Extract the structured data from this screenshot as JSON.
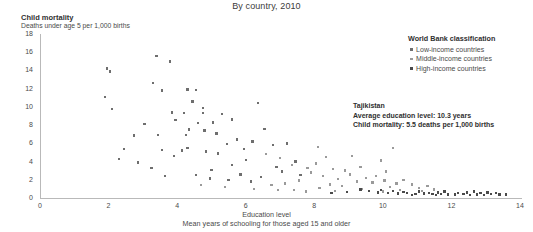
{
  "subtitle": "By country, 2010",
  "yaxis": {
    "title": "Child mortality",
    "subtitle": "Deaths under age 5 per 1,000 births"
  },
  "xaxis": {
    "title": "Education level",
    "subtitle": "Mean years of schooling for those aged 15 and older"
  },
  "legend": {
    "title": "World Bank classification",
    "items": [
      {
        "label": "Low-income countries",
        "color": "#6e6e6e"
      },
      {
        "label": "Middle-income countries",
        "color": "#9a9a9a"
      },
      {
        "label": "High-income countries",
        "color": "#4a4a4a"
      }
    ]
  },
  "annotation": {
    "name": "Tajikistan",
    "line1": "Average education level: 10.3 years",
    "line2": "Child mortality: 5.5 deaths per 1,000 births"
  },
  "chart_data": {
    "type": "scatter",
    "title": "",
    "subtitle": "By country, 2010",
    "xlabel": "Education level",
    "xlabel_sub": "Mean years of schooling for those aged 15 and older",
    "ylabel": "Child mortality",
    "ylabel_sub": "Deaths under age 5 per 1,000 births",
    "xlim": [
      0,
      14
    ],
    "ylim": [
      0,
      18
    ],
    "xticks": [
      0,
      2,
      4,
      6,
      8,
      10,
      12,
      14
    ],
    "yticks": [
      0,
      2,
      4,
      6,
      8,
      10,
      12,
      14,
      16,
      18
    ],
    "grid": false,
    "legend_position": "top-right",
    "marker": "square",
    "marker_size_px": 2.4,
    "series": [
      {
        "name": "Low-income countries",
        "color": "#6e6e6e",
        "points": [
          [
            1.95,
            14.2
          ],
          [
            2.05,
            13.9
          ],
          [
            1.9,
            11.1
          ],
          [
            2.1,
            9.8
          ],
          [
            3.4,
            15.6
          ],
          [
            3.8,
            15.0
          ],
          [
            3.3,
            12.6
          ],
          [
            3.55,
            11.8
          ],
          [
            4.3,
            11.9
          ],
          [
            4.55,
            11.85
          ],
          [
            4.45,
            10.6
          ],
          [
            4.75,
            9.9
          ],
          [
            3.85,
            9.4
          ],
          [
            4.2,
            9.35
          ],
          [
            4.75,
            9.3
          ],
          [
            3.95,
            8.55
          ],
          [
            4.6,
            8.2
          ],
          [
            3.05,
            8.1
          ],
          [
            4.35,
            7.5
          ],
          [
            4.8,
            7.4
          ],
          [
            3.45,
            6.9
          ],
          [
            4.25,
            6.9
          ],
          [
            2.75,
            6.85
          ],
          [
            5.05,
            8.3
          ],
          [
            4.3,
            5.5
          ],
          [
            4.85,
            5.1
          ],
          [
            3.9,
            4.6
          ],
          [
            5.3,
            9.2
          ],
          [
            5.6,
            8.6
          ],
          [
            5.15,
            7.1
          ],
          [
            5.75,
            6.4
          ],
          [
            5.45,
            5.9
          ],
          [
            5.95,
            5.4
          ],
          [
            5.2,
            4.9
          ],
          [
            6.0,
            4.2
          ],
          [
            5.6,
            3.6
          ],
          [
            6.35,
            10.4
          ],
          [
            6.55,
            7.6
          ],
          [
            6.2,
            6.2
          ],
          [
            6.8,
            5.8
          ],
          [
            2.45,
            5.4
          ],
          [
            3.55,
            5.3
          ],
          [
            4.15,
            5.2
          ],
          [
            5.0,
            3.1
          ],
          [
            5.85,
            2.6
          ],
          [
            6.45,
            2.3
          ],
          [
            4.55,
            2.5
          ],
          [
            3.65,
            2.4
          ],
          [
            4.95,
            2.15
          ],
          [
            5.5,
            1.95
          ],
          [
            6.15,
            1.8
          ],
          [
            6.9,
            3.4
          ],
          [
            7.2,
            6.0
          ],
          [
            7.45,
            4.0
          ],
          [
            7.05,
            2.9
          ],
          [
            7.6,
            2.5
          ],
          [
            2.85,
            3.9
          ],
          [
            3.25,
            3.3
          ],
          [
            2.3,
            4.3
          ]
        ]
      },
      {
        "name": "Middle-income countries",
        "color": "#9a9a9a",
        "points": [
          [
            6.6,
            4.8
          ],
          [
            7.0,
            4.4
          ],
          [
            7.35,
            3.6
          ],
          [
            7.8,
            3.3
          ],
          [
            8.1,
            5.6
          ],
          [
            8.35,
            4.5
          ],
          [
            8.05,
            3.8
          ],
          [
            8.55,
            3.2
          ],
          [
            7.9,
            2.8
          ],
          [
            8.25,
            2.4
          ],
          [
            8.7,
            2.1
          ],
          [
            8.9,
            3.0
          ],
          [
            9.1,
            4.6
          ],
          [
            9.35,
            3.4
          ],
          [
            9.05,
            2.6
          ],
          [
            9.5,
            2.2
          ],
          [
            9.25,
            1.8
          ],
          [
            9.7,
            1.7
          ],
          [
            8.45,
            1.5
          ],
          [
            8.8,
            1.3
          ],
          [
            9.95,
            4.1
          ],
          [
            10.1,
            2.9
          ],
          [
            9.8,
            2.4
          ],
          [
            10.3,
            5.5
          ],
          [
            10.05,
            1.9
          ],
          [
            10.4,
            1.6
          ],
          [
            10.2,
            1.2
          ],
          [
            10.6,
            2.0
          ],
          [
            7.55,
            1.9
          ],
          [
            7.15,
            1.6
          ],
          [
            6.75,
            1.4
          ],
          [
            8.15,
            1.1
          ],
          [
            9.4,
            1.0
          ],
          [
            10.85,
            1.5
          ],
          [
            11.05,
            1.1
          ],
          [
            10.5,
            0.9
          ],
          [
            7.4,
            0.9
          ],
          [
            8.6,
            0.8
          ],
          [
            9.6,
            0.75
          ],
          [
            10.0,
            0.7
          ],
          [
            11.3,
            1.3
          ],
          [
            11.5,
            0.95
          ],
          [
            11.15,
            0.8
          ],
          [
            6.95,
            0.85
          ],
          [
            5.4,
            1.2
          ],
          [
            6.25,
            1.0
          ],
          [
            4.7,
            1.4
          ],
          [
            7.75,
            0.7
          ]
        ]
      },
      {
        "name": "High-income countries",
        "color": "#4a4a4a",
        "points": [
          [
            9.85,
            0.6
          ],
          [
            10.15,
            0.55
          ],
          [
            10.45,
            0.5
          ],
          [
            10.7,
            0.58
          ],
          [
            10.95,
            0.45
          ],
          [
            11.2,
            0.48
          ],
          [
            11.45,
            0.42
          ],
          [
            11.7,
            0.45
          ],
          [
            11.9,
            0.4
          ],
          [
            12.1,
            0.38
          ],
          [
            12.35,
            0.42
          ],
          [
            12.55,
            0.36
          ],
          [
            12.75,
            0.4
          ],
          [
            12.95,
            0.35
          ],
          [
            13.15,
            0.45
          ],
          [
            13.4,
            0.4
          ],
          [
            13.6,
            0.38
          ],
          [
            12.2,
            0.55
          ],
          [
            11.6,
            0.62
          ],
          [
            11.05,
            0.7
          ],
          [
            10.3,
            0.75
          ],
          [
            9.6,
            0.8
          ],
          [
            12.45,
            0.6
          ],
          [
            12.85,
            0.52
          ],
          [
            13.05,
            0.6
          ],
          [
            11.35,
            0.55
          ],
          [
            10.6,
            0.65
          ],
          [
            9.95,
            0.85
          ],
          [
            9.35,
            0.95
          ],
          [
            8.95,
            0.65
          ],
          [
            8.5,
            0.55
          ],
          [
            11.8,
            0.7
          ],
          [
            12.65,
            0.7
          ],
          [
            13.3,
            0.55
          ],
          [
            10.85,
            0.35
          ],
          [
            11.55,
            0.3
          ]
        ]
      }
    ]
  }
}
